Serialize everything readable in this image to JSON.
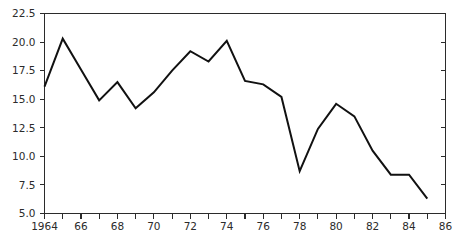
{
  "chart_data": {
    "type": "line",
    "title": "",
    "subtitle": "",
    "xlabel": "",
    "ylabel": "",
    "xlim": [
      1964,
      1986
    ],
    "ylim": [
      5.0,
      22.5
    ],
    "grid": false,
    "legend": false,
    "legend_position": "none",
    "line_color": "#111111",
    "axis_color": "#2b2b2b",
    "background_color": "#ffffff",
    "y_ticks": [
      5.0,
      7.5,
      10.0,
      12.5,
      15.0,
      17.5,
      20.0,
      22.5
    ],
    "y_tick_labels": [
      "5.0",
      "7.5",
      "10.0",
      "12.5",
      "15.0",
      "17.5",
      "20.0",
      "22.5"
    ],
    "x_ticks": [
      1964,
      1965,
      1966,
      1967,
      1968,
      1969,
      1970,
      1971,
      1972,
      1973,
      1974,
      1975,
      1976,
      1977,
      1978,
      1979,
      1980,
      1981,
      1982,
      1983,
      1984,
      1985,
      1986
    ],
    "x_tick_labels": [
      "1964",
      "",
      "66",
      "",
      "68",
      "",
      "70",
      "",
      "72",
      "",
      "74",
      "",
      "76",
      "",
      "78",
      "",
      "80",
      "",
      "82",
      "",
      "84",
      "",
      "86"
    ],
    "x": [
      1964,
      1965,
      1966,
      1967,
      1968,
      1969,
      1970,
      1971,
      1972,
      1973,
      1974,
      1975,
      1976,
      1977,
      1978,
      1979,
      1980,
      1981,
      1982,
      1983,
      1984,
      1985
    ],
    "values": [
      16.1,
      20.3,
      17.6,
      14.9,
      16.5,
      14.2,
      15.6,
      17.5,
      19.2,
      18.3,
      20.1,
      16.6,
      16.3,
      15.2,
      8.7,
      12.4,
      14.6,
      13.5,
      10.5,
      8.4,
      8.4,
      6.3
    ],
    "series": [
      {
        "name": "series-1",
        "values": [
          16.1,
          20.3,
          17.6,
          14.9,
          16.5,
          14.2,
          15.6,
          17.5,
          19.2,
          18.3,
          20.1,
          16.6,
          16.3,
          15.2,
          8.7,
          12.4,
          14.6,
          13.5,
          10.5,
          8.4,
          8.4,
          6.3
        ]
      }
    ]
  }
}
